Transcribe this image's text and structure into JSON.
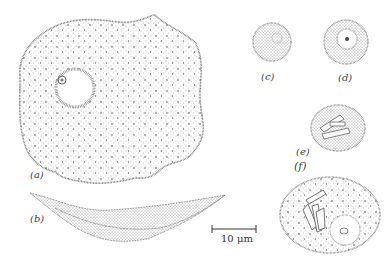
{
  "figure": {
    "panels": [
      {
        "id": "a",
        "label": "(a)",
        "description": "large flattened cell, top view, with nucleus"
      },
      {
        "id": "b",
        "label": "(b)",
        "description": "same cell in side view"
      },
      {
        "id": "c",
        "label": "(c)",
        "description": "small rounded cell"
      },
      {
        "id": "d",
        "label": "(d)",
        "description": "small rounded cell with nucleus"
      },
      {
        "id": "e",
        "label": "(e)",
        "description": "rounded cell with crystals"
      },
      {
        "id": "f",
        "label": "(f)",
        "description": "oval cell with crystals and nucleus"
      }
    ],
    "scale_bar": {
      "label": "10 μm"
    },
    "colors": {
      "ink": "#555555",
      "background": "#ffffff"
    }
  }
}
